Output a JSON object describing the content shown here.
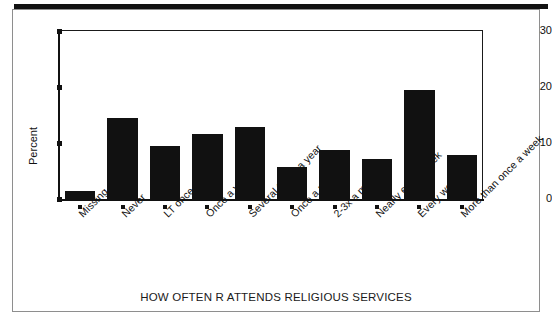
{
  "chart_data": {
    "type": "bar",
    "title": "",
    "xlabel": "HOW OFTEN R ATTENDS RELIGIOUS SERVICES",
    "ylabel": "Percent",
    "ylim": [
      0,
      30
    ],
    "yticks": [
      0,
      10,
      20,
      30
    ],
    "grid": false,
    "legend": null,
    "bar_color": "#111111",
    "categories": [
      "Missing",
      "Never",
      "LT once a year",
      "Once a year",
      "Several times a year",
      "Once a month",
      "2-3x a month",
      "Nearly every week",
      "Every week",
      "More than once a week"
    ],
    "values": [
      1.4,
      14.4,
      9.5,
      11.6,
      12.9,
      5.7,
      8.8,
      7.2,
      19.5,
      7.9
    ]
  }
}
